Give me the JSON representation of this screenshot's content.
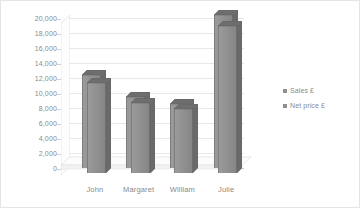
{
  "chart_data": {
    "type": "bar",
    "title": "",
    "subtitle": "",
    "xlabel": "",
    "ylabel": "",
    "categories": [
      "John",
      "Margaret",
      "William",
      "Julie"
    ],
    "series": [
      {
        "name": "Sales £",
        "values": [
          12400,
          9500,
          8600,
          20400
        ]
      },
      {
        "name": "Net price £",
        "values": [
          12000,
          9400,
          8500,
          19600
        ]
      }
    ],
    "ylim": [
      0,
      20000
    ],
    "ytick_step": 2000,
    "ytick_labels": [
      "0",
      "2,000",
      "4,000",
      "6,000",
      "8,000",
      "10,000",
      "12,000",
      "14,000",
      "16,000",
      "18,000",
      "20,000"
    ],
    "ytick_values": [
      0,
      2000,
      4000,
      6000,
      8000,
      10000,
      12000,
      14000,
      16000,
      18000,
      20000
    ],
    "grid": true,
    "legend_position": "right",
    "three_d": true,
    "colors": {
      "bar_front": "#949494",
      "bar_top": "#6e6e6e",
      "bar_side": "#6a6a6a",
      "gridline": "#e8e8e8",
      "axis": "#c9c9c9",
      "text": "#8a8a8a",
      "frame_border": "#e4e4e4",
      "floor": "#fbfbfb",
      "legend_swatch": "#8f8f8f",
      "background": "#ffffff"
    }
  },
  "legend": {
    "entries": [
      {
        "label": "Sales £"
      },
      {
        "label": "Net price £"
      }
    ]
  }
}
